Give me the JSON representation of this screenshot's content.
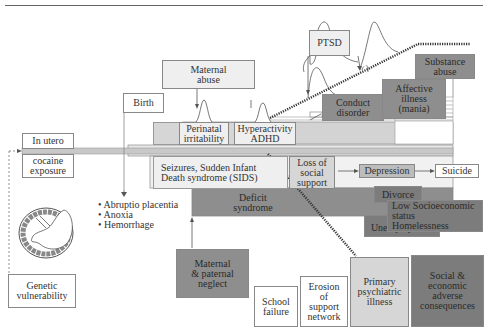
{
  "diagram": {
    "top_rule": true,
    "nodes": {
      "in_utero": "In utero",
      "cocaine_exposure": [
        "cocaine",
        "exposure"
      ],
      "birth": "Birth",
      "maternal_abuse": [
        "Maternal",
        "abuse"
      ],
      "ptsd": "PTSD",
      "perinatal_irritability": [
        "Perinatal",
        "irritability"
      ],
      "hyperactivity_adhd": [
        "Hyperactivity",
        "ADHD"
      ],
      "conduct_disorder": [
        "Conduct",
        "disorder"
      ],
      "affective_illness": [
        "Affective",
        "illness",
        "(mania)"
      ],
      "substance_abuse": [
        "Substance",
        "abuse"
      ],
      "seizures_sids": [
        "Seizures, Sudden Infant",
        "Death syndrome (SIDS)"
      ],
      "loss_social_support": [
        "Loss of",
        "social",
        "support"
      ],
      "depression": "Depression",
      "suicide": "Suicide",
      "deficit_syndrome": [
        "Deficit",
        "syndrome"
      ],
      "divorce": "Divorce",
      "low_ses": [
        "Low Socioeconomic",
        "status",
        "Homelessness"
      ],
      "unemployment": "Unemployment",
      "maternal_paternal_neglect": [
        "Maternal",
        "& paternal",
        "neglect"
      ],
      "school_failure": [
        "School",
        "failure"
      ],
      "erosion_support": [
        "Erosion",
        "of",
        "support",
        "network"
      ],
      "primary_psychiatric": [
        "Primary",
        "psychiatric",
        "illness"
      ],
      "social_economic": [
        "Social &",
        "economic",
        "adverse",
        "consequences"
      ],
      "genetic_vulnerability": [
        "Genetic",
        "vulnerability"
      ]
    },
    "birth_complications": [
      "Abruptio placentia",
      "Anoxia",
      "Hemorrhage"
    ],
    "colors": {
      "white": "#ffffff",
      "light": "#efefef",
      "mid": "#d6d6d6",
      "dark": "#8e8e8e",
      "darker": "#7c7c7c",
      "line": "#555555"
    }
  }
}
